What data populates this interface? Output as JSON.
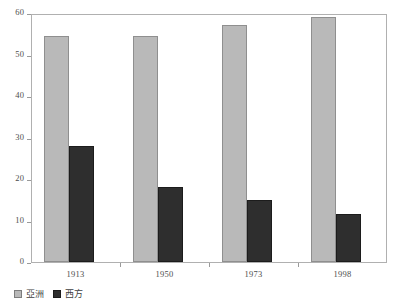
{
  "chart_data": {
    "type": "bar",
    "title": "",
    "subtitle": "",
    "xlabel": "",
    "ylabel": "",
    "categories": [
      "1913",
      "1950",
      "1973",
      "1998"
    ],
    "series": [
      {
        "name": "亞洲",
        "color": "#b9b9b9",
        "values": [
          54.5,
          54.5,
          57,
          59
        ]
      },
      {
        "name": "西方",
        "color": "#2e2e2e",
        "values": [
          28,
          18,
          15,
          11.5
        ]
      }
    ],
    "ylim": [
      0,
      60
    ],
    "yticks": [
      0,
      10,
      20,
      30,
      40,
      50,
      60
    ],
    "ytick_labels": [
      "0",
      "10",
      "20",
      "30",
      "40",
      "50",
      "60"
    ],
    "grid": false,
    "legend_position": "bottom-left",
    "annotations": []
  },
  "colors": {
    "asia": "#b9b9b9",
    "west": "#2e2e2e",
    "frame": "#b0b0b0",
    "axis_text": "#4d4d4d",
    "background": "#ffffff"
  }
}
